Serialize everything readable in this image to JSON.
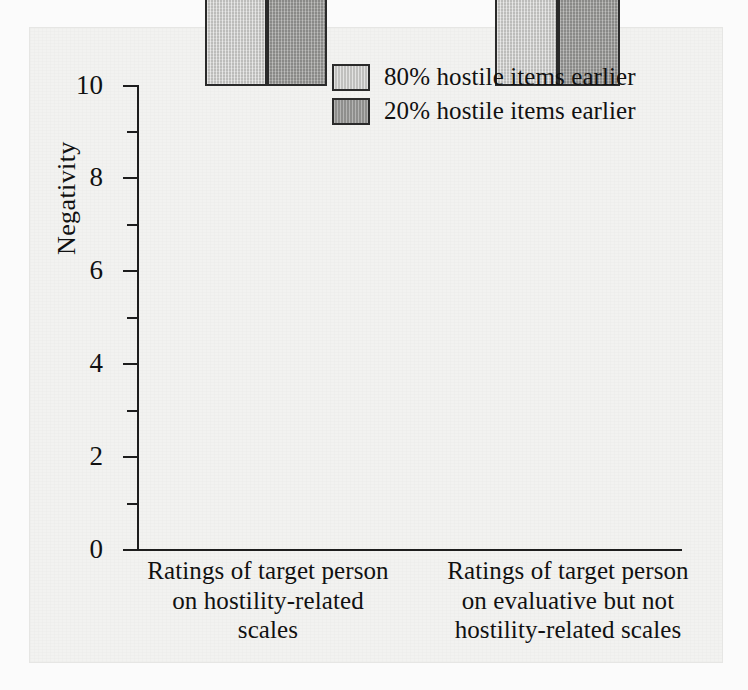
{
  "chart_data": {
    "type": "bar",
    "title": "",
    "xlabel": "",
    "ylabel": "Negativity",
    "ylim": [
      0,
      10
    ],
    "ytick_labels": [
      "0",
      "2",
      "4",
      "6",
      "8",
      "10"
    ],
    "ytick_values": [
      0,
      2,
      4,
      6,
      8,
      10
    ],
    "yminor_values": [
      1,
      3,
      5,
      7,
      9
    ],
    "grid": false,
    "legend_position": "top-right",
    "categories": [
      "Ratings of target person on hostility-related scales",
      "Ratings of target person on evaluative but not hostility-related scales"
    ],
    "category_lines": [
      [
        "Ratings of target person",
        "on hostility-related",
        "scales"
      ],
      [
        "Ratings of target person",
        "on evaluative but not",
        "hostility-related scales"
      ]
    ],
    "series": [
      {
        "name": "80% hostile items earlier",
        "color": "#c6c6c4",
        "values": [
          9.3,
          6.85
        ]
      },
      {
        "name": "20% hostile items earlier",
        "color": "#969694",
        "values": [
          6.2,
          4.05
        ]
      }
    ]
  },
  "figure": {
    "background": "#f2f2f0",
    "axis_color": "#1d1d1d",
    "text_color": "#111111"
  }
}
